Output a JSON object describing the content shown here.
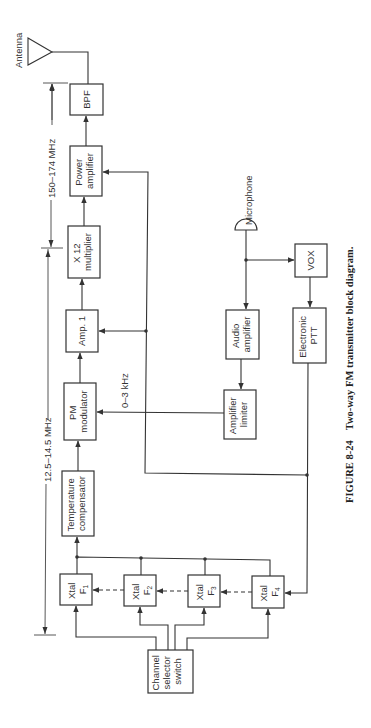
{
  "diagram": {
    "caption": {
      "figure_label": "FIGURE 8-24",
      "title": "Two-way FM transmitter block diagram."
    },
    "annotations": {
      "antenna": "Antenna",
      "microphone": "Microphone",
      "rf_band": "150–174 MHz",
      "if_band": "12.5–14.5 MHz",
      "audio_band": "0–3 kHz"
    },
    "blocks": {
      "bpf": [
        "BPF"
      ],
      "power_amp": [
        "Power",
        "amplifier"
      ],
      "multiplier": [
        "X 12",
        "multiplier"
      ],
      "amp1": [
        "Amp. 1"
      ],
      "pm_mod": [
        "PM",
        "modulator"
      ],
      "temp_comp": [
        "Temperature",
        "compensator"
      ],
      "xtal1": {
        "name": "Xtal",
        "sym": "F",
        "sub": "1"
      },
      "xtal2": {
        "name": "Xtal",
        "sym": "F",
        "sub": "2"
      },
      "xtal3": {
        "name": "Xtal",
        "sym": "F",
        "sub": "3"
      },
      "xtal4": {
        "name": "Xtal",
        "sym": "F",
        "sub": "4"
      },
      "channel_sel": [
        "Channel",
        "selector",
        "switch"
      ],
      "audio_amp": [
        "Audio",
        "amplifier"
      ],
      "amp_limiter": [
        "Amplifier",
        "limiter"
      ],
      "vox": [
        "VOX"
      ],
      "ptt": [
        "Electronic",
        "PTT"
      ]
    }
  }
}
